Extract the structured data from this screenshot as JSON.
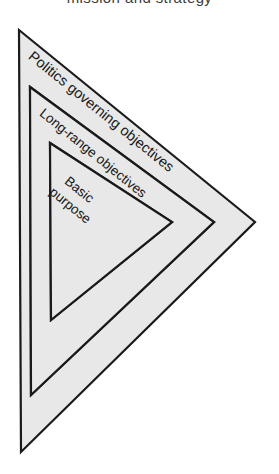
{
  "figure": {
    "type": "nested-triangle-hierarchy",
    "background_color": "#ffffff",
    "band_fill_color": "#e8e8e8",
    "band_stroke_color": "#1a1a1a",
    "title_partial_top": "mission and strategy"
  },
  "bands": [
    {
      "id": "outer",
      "label": "Politics governing objectives",
      "font_size": 14.5,
      "rotation_deg": 39,
      "label_x": 30,
      "label_y": 55
    },
    {
      "id": "middle",
      "label": "Long-range objectives",
      "font_size": 13.5,
      "rotation_deg": 39,
      "label_x": 41,
      "label_y": 112
    }
  ],
  "core": {
    "id": "inner",
    "label_line1": "Basic",
    "label_line2": "purpose",
    "font_size": 13.5,
    "rotation_deg": 39,
    "label_x": 62,
    "label_y": 178
  }
}
